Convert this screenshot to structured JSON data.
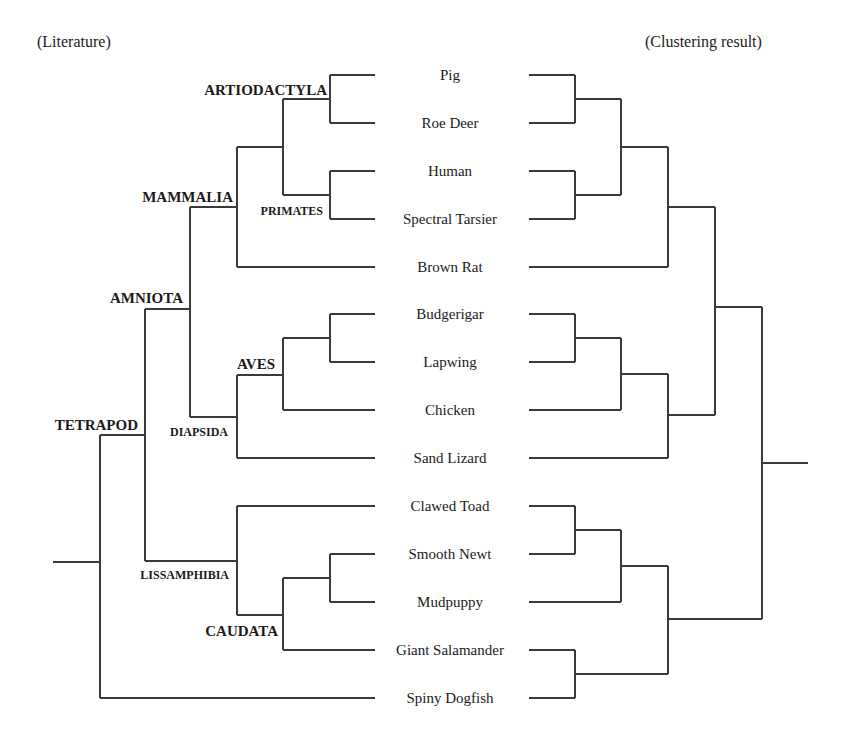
{
  "titles": {
    "left": "(Literature)",
    "right": "(Clustering result)"
  },
  "leaves": [
    {
      "name": "Pig",
      "y": 75
    },
    {
      "name": "Roe Deer",
      "y": 123
    },
    {
      "name": "Human",
      "y": 171
    },
    {
      "name": "Spectral Tarsier",
      "y": 219
    },
    {
      "name": "Brown Rat",
      "y": 267
    },
    {
      "name": "Budgerigar",
      "y": 314
    },
    {
      "name": "Lapwing",
      "y": 362
    },
    {
      "name": "Chicken",
      "y": 410
    },
    {
      "name": "Sand Lizard",
      "y": 458
    },
    {
      "name": "Clawed Toad",
      "y": 506
    },
    {
      "name": "Smooth Newt",
      "y": 554
    },
    {
      "name": "Mudpuppy",
      "y": 602
    },
    {
      "name": "Giant Salamander",
      "y": 650
    },
    {
      "name": "Spiny Dogfish",
      "y": 698
    }
  ],
  "clade_labels": [
    {
      "name": "ARTIODACTYLA",
      "x": 327,
      "y": 95,
      "size": 15
    },
    {
      "name": "PRIMATES",
      "x": 323,
      "y": 215,
      "size": 12
    },
    {
      "name": "MAMMALIA",
      "x": 233,
      "y": 202,
      "size": 15
    },
    {
      "name": "AMNIOTA",
      "x": 183,
      "y": 303,
      "size": 15
    },
    {
      "name": "AVES",
      "x": 275,
      "y": 369,
      "size": 15
    },
    {
      "name": "DIAPSIDA",
      "x": 228,
      "y": 436,
      "size": 12
    },
    {
      "name": "TETRAPOD",
      "x": 138,
      "y": 430,
      "size": 15
    },
    {
      "name": "LISSAMPHIBIA",
      "x": 229,
      "y": 579,
      "size": 12
    },
    {
      "name": "CAUDATA",
      "x": 278,
      "y": 636,
      "size": 15
    }
  ],
  "literature_tree": {
    "segments": [
      [
        330,
        75,
        375,
        75
      ],
      [
        330,
        123,
        375,
        123
      ],
      [
        330,
        75,
        330,
        123
      ],
      [
        283,
        99,
        330,
        99
      ],
      [
        330,
        171,
        375,
        171
      ],
      [
        330,
        219,
        375,
        219
      ],
      [
        330,
        171,
        330,
        219
      ],
      [
        283,
        195,
        330,
        195
      ],
      [
        283,
        99,
        283,
        195
      ],
      [
        237,
        147,
        283,
        147
      ],
      [
        237,
        267,
        375,
        267
      ],
      [
        237,
        147,
        237,
        267
      ],
      [
        190,
        207,
        237,
        207
      ],
      [
        330,
        314,
        375,
        314
      ],
      [
        330,
        362,
        375,
        362
      ],
      [
        330,
        314,
        330,
        362
      ],
      [
        283,
        338,
        330,
        338
      ],
      [
        283,
        410,
        375,
        410
      ],
      [
        283,
        338,
        283,
        410
      ],
      [
        237,
        375,
        283,
        375
      ],
      [
        237,
        458,
        375,
        458
      ],
      [
        237,
        375,
        237,
        458
      ],
      [
        190,
        417,
        237,
        417
      ],
      [
        190,
        207,
        190,
        417
      ],
      [
        145,
        309,
        190,
        309
      ],
      [
        237,
        506,
        375,
        506
      ],
      [
        330,
        554,
        375,
        554
      ],
      [
        330,
        602,
        375,
        602
      ],
      [
        330,
        554,
        330,
        602
      ],
      [
        283,
        578,
        330,
        578
      ],
      [
        283,
        650,
        375,
        650
      ],
      [
        283,
        578,
        283,
        650
      ],
      [
        237,
        615,
        283,
        615
      ],
      [
        237,
        506,
        237,
        615
      ],
      [
        145,
        561,
        237,
        561
      ],
      [
        145,
        309,
        145,
        561
      ],
      [
        100,
        435,
        145,
        435
      ],
      [
        100,
        698,
        375,
        698
      ],
      [
        100,
        435,
        100,
        698
      ],
      [
        53,
        562,
        100,
        562
      ]
    ]
  },
  "clustering_tree": {
    "segments": [
      [
        529,
        75,
        575,
        75
      ],
      [
        529,
        123,
        575,
        123
      ],
      [
        575,
        75,
        575,
        123
      ],
      [
        575,
        99,
        621,
        99
      ],
      [
        529,
        171,
        575,
        171
      ],
      [
        529,
        219,
        575,
        219
      ],
      [
        575,
        171,
        575,
        219
      ],
      [
        575,
        195,
        621,
        195
      ],
      [
        621,
        99,
        621,
        195
      ],
      [
        621,
        147,
        668,
        147
      ],
      [
        529,
        267,
        668,
        267
      ],
      [
        668,
        147,
        668,
        267
      ],
      [
        668,
        207,
        715,
        207
      ],
      [
        529,
        314,
        575,
        314
      ],
      [
        529,
        362,
        575,
        362
      ],
      [
        575,
        314,
        575,
        362
      ],
      [
        575,
        338,
        621,
        338
      ],
      [
        529,
        410,
        621,
        410
      ],
      [
        621,
        338,
        621,
        410
      ],
      [
        621,
        374,
        668,
        374
      ],
      [
        529,
        458,
        668,
        458
      ],
      [
        668,
        374,
        668,
        458
      ],
      [
        668,
        415,
        715,
        415
      ],
      [
        715,
        207,
        715,
        415
      ],
      [
        715,
        307,
        762,
        307
      ],
      [
        529,
        506,
        575,
        506
      ],
      [
        529,
        554,
        575,
        554
      ],
      [
        575,
        506,
        575,
        554
      ],
      [
        575,
        530,
        621,
        530
      ],
      [
        529,
        602,
        621,
        602
      ],
      [
        621,
        530,
        621,
        602
      ],
      [
        621,
        566,
        668,
        566
      ],
      [
        529,
        650,
        575,
        650
      ],
      [
        529,
        698,
        575,
        698
      ],
      [
        575,
        650,
        575,
        698
      ],
      [
        575,
        674,
        668,
        674
      ],
      [
        668,
        566,
        668,
        674
      ],
      [
        668,
        619,
        762,
        619
      ],
      [
        762,
        307,
        762,
        619
      ],
      [
        762,
        463,
        808,
        463
      ]
    ]
  },
  "layout": {
    "leaf_label_center_x": 450,
    "left_title_x": 37,
    "right_title_x": 645,
    "title_y": 47,
    "line_color": "#3a3a3a",
    "text_color": "#1a1a1a"
  }
}
